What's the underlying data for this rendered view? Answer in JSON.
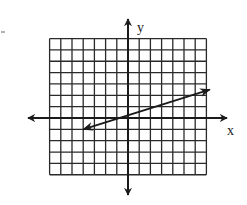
{
  "diagram": {
    "type": "coordinate-plane",
    "axes": {
      "x_label": "x",
      "y_label": "y",
      "x_range_cells": [
        -7,
        7
      ],
      "y_range_cells": [
        -5,
        7
      ]
    },
    "grid": {
      "columns": 14,
      "rows": 12,
      "cols_left_of_y_axis": 7,
      "rows_above_x_axis": 7,
      "line_color": "#2a2a2a"
    },
    "line": {
      "description": "Line with arrows on both ends, passing through the origin",
      "start": [
        -4,
        -1
      ],
      "end": [
        7.3,
        2.5
      ],
      "arrows": "both",
      "color": "#1a1a1a"
    },
    "colors": {
      "background": "#ffffff",
      "ink": "#1a1a1a"
    }
  }
}
